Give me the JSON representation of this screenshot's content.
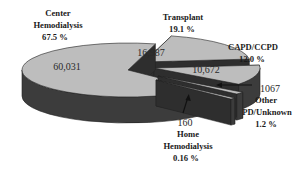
{
  "chart_data": {
    "type": "pie",
    "style": "3d-exploded",
    "title": "",
    "categories": [
      "Center Hemodialysis",
      "Transplant",
      "CAPD/CCPD",
      "Other PD/Unknown",
      "Home Hemodialysis"
    ],
    "values": [
      60031,
      16987,
      10672,
      1067,
      160
    ],
    "percentages": [
      67.5,
      19.1,
      12.0,
      1.2,
      0.16
    ],
    "slices": [
      {
        "name": "Center Hemodialysis",
        "value": 60031,
        "value_label": "60,031",
        "pct_label": "67.5 %",
        "label_lines": [
          "Center",
          "Hemodialysis"
        ]
      },
      {
        "name": "Transplant",
        "value": 16987,
        "value_label": "16,987",
        "pct_label": "19.1 %",
        "label_lines": [
          "Transplant"
        ]
      },
      {
        "name": "CAPD/CCPD",
        "value": 10672,
        "value_label": "10,672",
        "pct_label": "12.0 %",
        "label_lines": [
          "CAPD/CCPD"
        ]
      },
      {
        "name": "Other PD/Unknown",
        "value": 1067,
        "value_label": "1067",
        "pct_label": "1.2 %",
        "label_lines": [
          "Other",
          "PD/Unknown"
        ]
      },
      {
        "name": "Home Hemodialysis",
        "value": 160,
        "value_label": "160",
        "pct_label": "0.16 %",
        "label_lines": [
          "Home",
          "Hemodialysis"
        ]
      }
    ],
    "legend": "none",
    "grid": false
  },
  "colors": {
    "top_face": "#bdbdbd",
    "side_face": "#3c3c3c",
    "edge": "#222222",
    "text": "#1a1a1a"
  }
}
